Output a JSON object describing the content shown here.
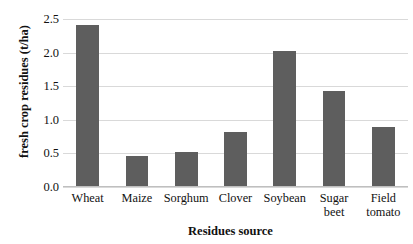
{
  "chart_data": {
    "type": "bar",
    "title": "",
    "xlabel": "Residues source",
    "ylabel": "fresh crop residues (t/ha)",
    "categories": [
      "Wheat",
      "Maize",
      "Sorghum",
      "Clover",
      "Soybean",
      "Sugar beet",
      "Field tomato"
    ],
    "category_lines": [
      [
        "Wheat"
      ],
      [
        "Maize"
      ],
      [
        "Sorghum"
      ],
      [
        "Clover"
      ],
      [
        "Soybean"
      ],
      [
        "Sugar",
        "beet"
      ],
      [
        "Field",
        "tomato"
      ]
    ],
    "values": [
      2.4,
      0.45,
      0.51,
      0.81,
      2.01,
      1.42,
      0.88
    ],
    "ylim": [
      0.0,
      2.5
    ],
    "yticks": [
      0.0,
      0.5,
      1.0,
      1.5,
      2.0,
      2.5
    ],
    "ytick_labels": [
      "0.0",
      "0.5",
      "1.0",
      "1.5",
      "2.0",
      "2.5"
    ],
    "grid": true,
    "legend": null,
    "bar_color": "#5e5e5e",
    "gridline_color": "#d9d9d9",
    "background_color": "#ffffff",
    "text_color": "#111111"
  }
}
